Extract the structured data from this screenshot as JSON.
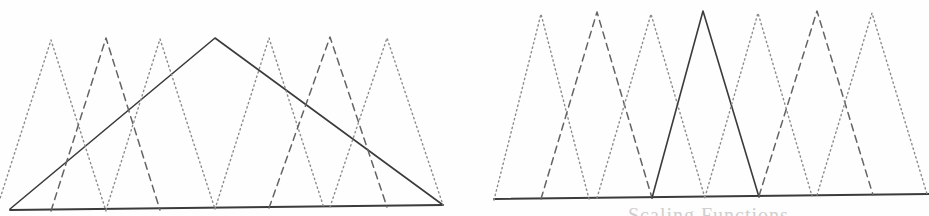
{
  "figure": {
    "background_color": "#fefefe",
    "width": 929,
    "height": 216,
    "caption_fragment": "Scaling Functions"
  },
  "styles": {
    "solid_color": "#3b3b3b",
    "dashed_color": "#646464",
    "dotted_color": "#8c8c8c",
    "baseline_color": "#3b3b3b",
    "solid_width": 1.6,
    "dashed_width": 1.5,
    "dotted_width": 1.4,
    "dash_pattern": "7,5",
    "dot_pattern": "1.4,3.2"
  },
  "chart_data": {
    "type": "line",
    "subtitle": "Left: coarse-scale hat overlaid on fine-scale hats. Right: single fine-scale hat highlighted.",
    "xlabel": "",
    "ylabel": "",
    "grid": false,
    "legend": "none",
    "panels": [
      {
        "name": "left-panel",
        "label": "Coarse scaling function",
        "xlim": [
          0,
          465
        ],
        "ylim": [
          0,
          216
        ],
        "baseline_y": 209,
        "baseline_x": [
          10,
          443
        ],
        "series": [
          {
            "name": "coarse-hat-solid",
            "style": "solid",
            "points": [
              [
                10,
                209
              ],
              [
                215,
                38
              ],
              [
                443,
                205
              ]
            ]
          },
          {
            "name": "fine-hat-1-dotted",
            "style": "dotted",
            "points": [
              [
                -4,
                211
              ],
              [
                51,
                40
              ],
              [
                106,
                211
              ]
            ]
          },
          {
            "name": "fine-hat-2-dashed",
            "style": "dashed",
            "points": [
              [
                51,
                211
              ],
              [
                106,
                38
              ],
              [
                160,
                210
              ]
            ]
          },
          {
            "name": "fine-hat-3-dotted",
            "style": "dotted",
            "points": [
              [
                106,
                210
              ],
              [
                160,
                39
              ],
              [
                215,
                209
              ]
            ]
          },
          {
            "name": "fine-hat-4-dotted",
            "style": "dotted",
            "points": [
              [
                215,
                209
              ],
              [
                269,
                38
              ],
              [
                324,
                208
              ]
            ]
          },
          {
            "name": "fine-hat-5-dashed",
            "style": "dashed",
            "points": [
              [
                269,
                208
              ],
              [
                330,
                37
              ],
              [
                387,
                207
              ]
            ]
          },
          {
            "name": "fine-hat-6-dotted",
            "style": "dotted",
            "points": [
              [
                330,
                207
              ],
              [
                387,
                38
              ],
              [
                443,
                205
              ]
            ]
          }
        ]
      },
      {
        "name": "right-panel",
        "label": "Fine scaling function",
        "xlim": [
          0,
          464
        ],
        "ylim": [
          0,
          216
        ],
        "baseline_y": 198,
        "baseline_x": [
          29,
          464
        ],
        "series": [
          {
            "name": "fine-hat-1-dotted",
            "style": "dotted",
            "points": [
              [
                29,
                200
              ],
              [
                76,
                14
              ],
              [
                124,
                199
              ]
            ]
          },
          {
            "name": "fine-hat-2-dashed",
            "style": "dashed",
            "points": [
              [
                76,
                199
              ],
              [
                132,
                12
              ],
              [
                187,
                198
              ]
            ]
          },
          {
            "name": "fine-hat-3-dotted",
            "style": "dotted",
            "points": [
              [
                132,
                198
              ],
              [
                186,
                14
              ],
              [
                240,
                198
              ]
            ]
          },
          {
            "name": "selected-hat-solid",
            "style": "solid",
            "points": [
              [
                187,
                198
              ],
              [
                238,
                11
              ],
              [
                294,
                197
              ]
            ]
          },
          {
            "name": "fine-hat-5-dotted",
            "style": "dotted",
            "points": [
              [
                240,
                197
              ],
              [
                293,
                13
              ],
              [
                347,
                196
              ]
            ]
          },
          {
            "name": "fine-hat-6-dashed",
            "style": "dashed",
            "points": [
              [
                294,
                196
              ],
              [
                352,
                11
              ],
              [
                408,
                195
              ]
            ]
          },
          {
            "name": "fine-hat-7-dotted",
            "style": "dotted",
            "points": [
              [
                352,
                195
              ],
              [
                407,
                13
              ],
              [
                462,
                194
              ]
            ]
          }
        ]
      }
    ]
  }
}
